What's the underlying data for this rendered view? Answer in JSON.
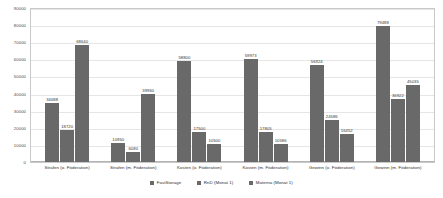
{
  "chart_data": {
    "type": "bar",
    "title": "",
    "xlabel": "",
    "ylabel": "",
    "ylim": [
      0,
      90000
    ],
    "yticks": [
      0,
      10000,
      20000,
      30000,
      40000,
      50000,
      60000,
      70000,
      80000,
      90000
    ],
    "grid": true,
    "legend_position": "bottom",
    "bar_color": "#696969",
    "categories": [
      "Strafen (o. Föderation)",
      "Strafen (m. Föderation)",
      "Kosten (o. Föderation)",
      "Kosten (m. Föderation)",
      "Gewinn (o. Föderation)",
      "Gewinn (m. Föderation)"
    ],
    "series": [
      {
        "name": "FastStorage",
        "values": [
          34688,
          10950,
          58800,
          59973,
          56924,
          79488
        ]
      },
      {
        "name": "RnD (Monat 1)",
        "values": [
          18720,
          6080,
          17500,
          17805,
          24586,
          36922
        ]
      },
      {
        "name": "Materna (Monat 1)",
        "values": [
          68640,
          39960,
          10500,
          10586,
          16452,
          45035
        ]
      }
    ]
  }
}
